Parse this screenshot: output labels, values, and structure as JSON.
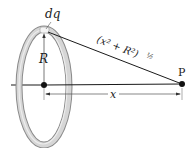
{
  "diagram": {
    "title": "",
    "labels": {
      "charge_element": "dq",
      "radius": "R",
      "distance_expr": "(x² + R²)",
      "distance_exponent": "½",
      "axis_distance": "x",
      "point": "P"
    },
    "colors": {
      "ring_outer": "#8a8a8a",
      "ring_fill": "#d4d4d4",
      "ring_highlight": "#f0f0f0",
      "line": "#1a1a1a",
      "dimension": "#555555"
    },
    "geometry": {
      "ring_center": [
        44,
        85
      ],
      "ring_rx": 24,
      "ring_ry": 57,
      "point_P": [
        182,
        84
      ],
      "dq_point": [
        46,
        31
      ]
    }
  }
}
